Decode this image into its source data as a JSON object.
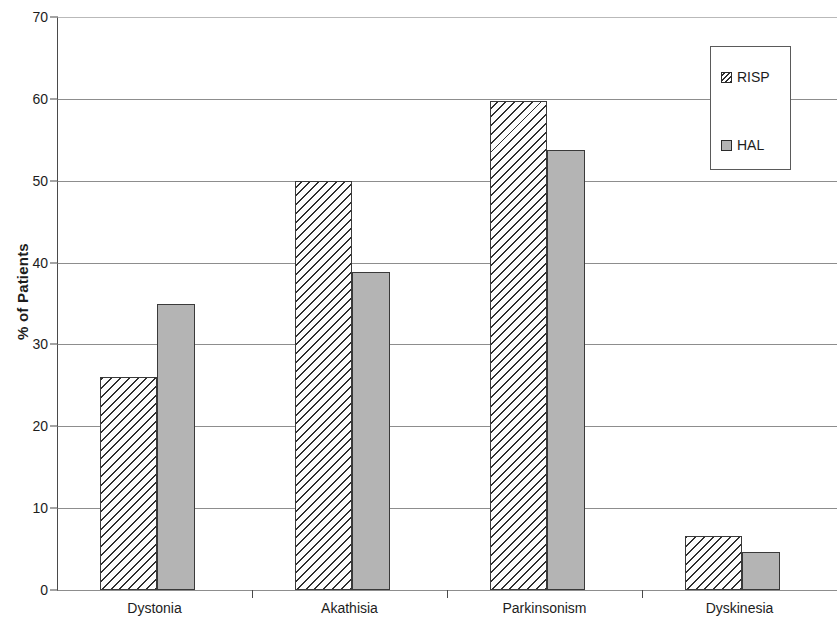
{
  "chart_data": {
    "type": "bar",
    "title": "",
    "xlabel": "",
    "ylabel": "% of Patients",
    "categories": [
      "Dystonia",
      "Akathisia",
      "Parkinsonism",
      "Dyskinesia"
    ],
    "series": [
      {
        "name": "RISP",
        "values": [
          26.0,
          50.0,
          59.8,
          6.6
        ],
        "style": "hatched",
        "color": "#ffffff"
      },
      {
        "name": "HAL",
        "values": [
          34.9,
          38.8,
          53.7,
          4.6
        ],
        "style": "solid-gray",
        "color": "#b4b4b4"
      }
    ],
    "ylim": [
      0,
      70
    ],
    "yticks": [
      0,
      10,
      20,
      30,
      40,
      50,
      60,
      70
    ],
    "ytick_labels": [
      "0",
      "10",
      "20",
      "30",
      "40",
      "50",
      "60",
      "70"
    ],
    "grid": true,
    "grid_axis": "y",
    "legend_position": "top-right",
    "axis_color": "#4a4a4a",
    "grid_color": "#8d8d8d"
  },
  "legend": {
    "entries": [
      {
        "label": "RISP"
      },
      {
        "label": "HAL"
      }
    ]
  }
}
